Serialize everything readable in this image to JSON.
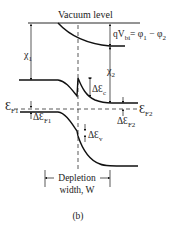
{
  "diagram": {
    "vacuum_label": "Vacuum level",
    "qvbi_label": "qV",
    "qvbi_sub": "bi",
    "qvbi_eq": "= φ",
    "phi1_sub": "1",
    "minus": " − φ",
    "phi2_sub": "2",
    "chi1": "χ",
    "chi1_sub": "1",
    "chi2": "χ",
    "chi2_sub": "2",
    "delta_ec": "ΔƐ",
    "delta_ec_sub": "c",
    "ef1": "Ɛ",
    "ef1_sub": "F1",
    "ef2": "Ɛ",
    "ef2_sub": "F2",
    "delta_ef1": "ΔƐ",
    "delta_ef1_sub": "F1",
    "delta_ef2": "ΔƐ",
    "delta_ef2_sub": "F2",
    "delta_ev": "ΔƐ",
    "delta_ev_sub": "v",
    "depletion_line1": "Depletion",
    "depletion_line2": "width, W",
    "caption": "(b)"
  },
  "colors": {
    "line": "#111111",
    "text": "#222222"
  }
}
